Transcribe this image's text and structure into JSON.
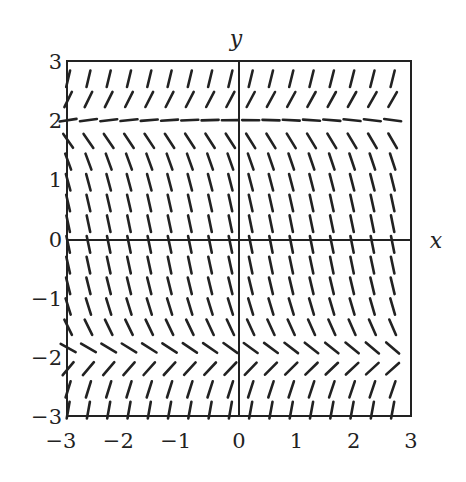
{
  "chart_data": {
    "type": "slope_field",
    "title": "",
    "equation_hint": "dy/dx proportional to (y - 2)(y + 2); equilibria at y = 2 and y = -2",
    "xlabel": "x",
    "ylabel": "y",
    "xlim": [
      -3,
      3
    ],
    "ylim": [
      -3,
      3
    ],
    "x_ticks": [
      "-3",
      "-2",
      "-1",
      "0",
      "1",
      "2",
      "3"
    ],
    "y_ticks": [
      "3",
      "2",
      "1",
      "0",
      "-1",
      "-2",
      "-3"
    ],
    "grid": false,
    "legend": null,
    "segment_grid": {
      "columns": 17,
      "rows": 17,
      "x_start": -2.98,
      "x_end": 2.68,
      "y_start": -2.9,
      "y_end": 2.7,
      "segment_length_px": 17
    },
    "regions": [
      {
        "y_range": "y > 2",
        "slope_sign": "positive"
      },
      {
        "y_range": "y = 2",
        "slope_sign": "zero (equilibrium)"
      },
      {
        "y_range": "-2 < y < 2",
        "slope_sign": "negative"
      },
      {
        "y_range": "y = -2",
        "slope_sign": "zero (equilibrium)"
      },
      {
        "y_range": "y < -2",
        "slope_sign": "positive"
      }
    ]
  },
  "colors": {
    "line": "#222222",
    "background": "#ffffff"
  }
}
